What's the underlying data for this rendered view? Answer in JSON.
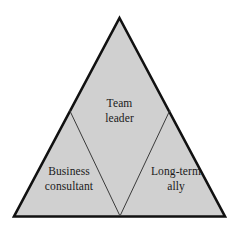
{
  "diagram": {
    "type": "triangle-partition",
    "shape_name": "triangle",
    "background_color": "#ffffff",
    "fill_color": "#d0d0d0",
    "outline_color": "#111111",
    "divider_color": "#3a3a3a",
    "text_color": "#1a1a1a",
    "zones": [
      {
        "id": "top",
        "name": "team-leader",
        "lines": [
          "Team",
          "leader"
        ],
        "line1": "Team",
        "line2": "leader"
      },
      {
        "id": "bottom-left",
        "name": "business-consultant",
        "lines": [
          "Business",
          "consultant"
        ],
        "line1": "Business",
        "line2": "consultant"
      },
      {
        "id": "bottom-right",
        "name": "long-term-ally",
        "lines": [
          "Long-term",
          "ally"
        ],
        "line1": "Long-term",
        "line2": "ally"
      }
    ]
  }
}
